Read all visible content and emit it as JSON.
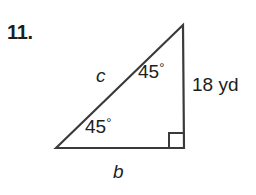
{
  "figure": {
    "problem_number": "11.",
    "type": "right-triangle-diagram",
    "colors": {
      "stroke": "#3a3a3a",
      "text": "#1d1d1d",
      "background": "#ffffff"
    },
    "labels": {
      "hypotenuse": "c",
      "base": "b",
      "angle_upper": "45",
      "angle_lower": "45",
      "degree_symbol": "°",
      "vertical_measure": "18 yd"
    },
    "geometry": {
      "left_vertex": [
        56,
        148
      ],
      "apex_vertex": [
        183,
        25
      ],
      "right_vertex": [
        184,
        148
      ],
      "right_angle_marker_size": 15,
      "stroke_width": 2.2
    }
  }
}
